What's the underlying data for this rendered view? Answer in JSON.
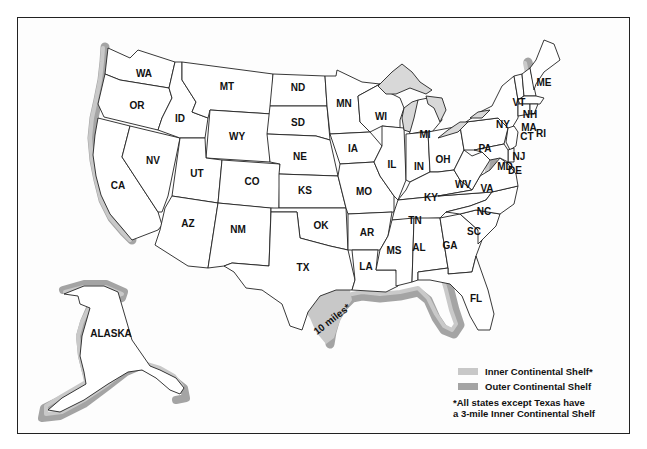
{
  "map": {
    "states": {
      "WA": "WA",
      "OR": "OR",
      "CA": "CA",
      "ID": "ID",
      "NV": "NV",
      "MT": "MT",
      "WY": "WY",
      "UT": "UT",
      "AZ": "AZ",
      "CO": "CO",
      "NM": "NM",
      "ND": "ND",
      "SD": "SD",
      "NE": "NE",
      "KS": "KS",
      "OK": "OK",
      "TX": "TX",
      "MN": "MN",
      "IA": "IA",
      "MO": "MO",
      "AR": "AR",
      "LA": "LA",
      "WI": "WI",
      "IL": "IL",
      "MI": "MI",
      "IN": "IN",
      "KY": "KY",
      "TN": "TN",
      "MS": "MS",
      "AL": "AL",
      "GA": "GA",
      "FL": "FL",
      "SC": "SC",
      "NC": "NC",
      "VA": "VA",
      "WV": "WV",
      "OH": "OH",
      "PA": "PA",
      "NY": "NY",
      "VT": "VT",
      "NH": "NH",
      "ME": "ME",
      "MA": "MA",
      "CT": "CT",
      "RI": "RI",
      "NJ": "NJ",
      "DE": "DE",
      "MD": "MD",
      "AK": "ALASKA"
    },
    "texas_annotation": "10 miles*",
    "colors": {
      "inner_shelf": "#c8c8c8",
      "outer_shelf": "#a4a4a4",
      "lakes": "#d8d8d8",
      "border": "#222222"
    }
  },
  "legend": {
    "items": [
      {
        "label": "Inner Continental Shelf*",
        "color": "#c8c8c8"
      },
      {
        "label": "Outer Continental Shelf",
        "color": "#a4a4a4"
      }
    ],
    "note_line1": "*All states except Texas have",
    "note_line2": "a 3-mile Inner Continental Shelf"
  }
}
